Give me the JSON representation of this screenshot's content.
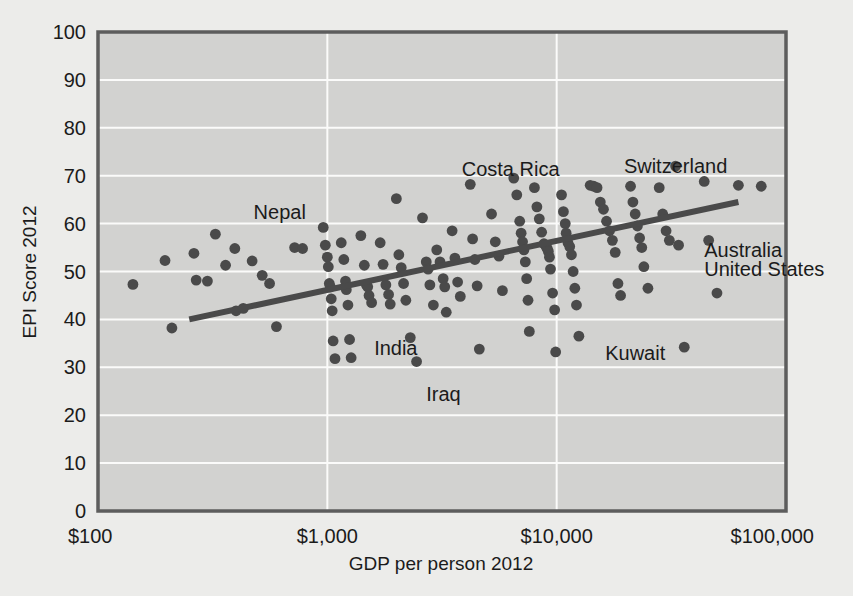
{
  "chart_data": {
    "type": "scatter",
    "title": "",
    "xlabel": "GDP per person 2012",
    "ylabel": "EPI Score 2012",
    "xscale": "log",
    "xlim": [
      100,
      100000
    ],
    "ylim": [
      0,
      100
    ],
    "grid": true,
    "legend": "none",
    "xticks": [
      "$100",
      "$1,000",
      "$10,000",
      "$100,000"
    ],
    "xtick_values": [
      100,
      1000,
      10000,
      100000
    ],
    "yticks": [
      "0",
      "10",
      "20",
      "30",
      "40",
      "50",
      "60",
      "70",
      "80",
      "90",
      "100"
    ],
    "ytick_values": [
      0,
      10,
      20,
      30,
      40,
      50,
      60,
      70,
      80,
      90,
      100
    ],
    "annotations": [
      {
        "text": "Nepal",
        "x": 620,
        "y": 62.5
      },
      {
        "text": "Costa Rica",
        "x": 6300,
        "y": 71.5
      },
      {
        "text": "Switzerland",
        "x": 33000,
        "y": 72.0
      },
      {
        "text": "Australia",
        "x": 44000,
        "y": 54.5
      },
      {
        "text": "United States",
        "x": 44000,
        "y": 50.5
      },
      {
        "text": "India",
        "x": 1600,
        "y": 34.0
      },
      {
        "text": "Iraq",
        "x": 2700,
        "y": 24.5
      },
      {
        "text": "Kuwait",
        "x": 22000,
        "y": 33.0
      }
    ],
    "trendline": {
      "x_start": 250,
      "y_start": 40.0,
      "x_end": 62000,
      "y_end": 64.5,
      "color": "#4a4a4a"
    },
    "series": [
      {
        "name": "Countries",
        "marker_color": "#4a4a4a",
        "points": [
          [
            142,
            47.3
          ],
          [
            196,
            52.3
          ],
          [
            210,
            38.2
          ],
          [
            262,
            53.8
          ],
          [
            268,
            48.2
          ],
          [
            300,
            48.0
          ],
          [
            325,
            57.8
          ],
          [
            360,
            51.3
          ],
          [
            395,
            54.8
          ],
          [
            400,
            41.8
          ],
          [
            430,
            42.3
          ],
          [
            470,
            52.2
          ],
          [
            520,
            49.2
          ],
          [
            560,
            47.5
          ],
          [
            600,
            38.5
          ],
          [
            720,
            55.0
          ],
          [
            780,
            54.8
          ],
          [
            960,
            59.2
          ],
          [
            980,
            55.5
          ],
          [
            1000,
            53.0
          ],
          [
            1010,
            51.0
          ],
          [
            1020,
            47.5
          ],
          [
            1030,
            46.8
          ],
          [
            1040,
            44.3
          ],
          [
            1050,
            41.8
          ],
          [
            1060,
            35.5
          ],
          [
            1080,
            31.8
          ],
          [
            1150,
            56.0
          ],
          [
            1180,
            52.5
          ],
          [
            1200,
            48.0
          ],
          [
            1210,
            46.2
          ],
          [
            1230,
            43.0
          ],
          [
            1250,
            35.8
          ],
          [
            1270,
            32.0
          ],
          [
            1400,
            57.5
          ],
          [
            1450,
            51.3
          ],
          [
            1480,
            47.2
          ],
          [
            1500,
            46.8
          ],
          [
            1520,
            45.0
          ],
          [
            1560,
            43.5
          ],
          [
            1700,
            56.0
          ],
          [
            1750,
            51.5
          ],
          [
            1800,
            47.2
          ],
          [
            1850,
            45.2
          ],
          [
            1880,
            43.2
          ],
          [
            2000,
            65.2
          ],
          [
            2050,
            53.5
          ],
          [
            2100,
            50.8
          ],
          [
            2150,
            47.5
          ],
          [
            2200,
            44.0
          ],
          [
            2300,
            36.2
          ],
          [
            2450,
            31.2
          ],
          [
            2600,
            61.2
          ],
          [
            2700,
            52.0
          ],
          [
            2750,
            50.5
          ],
          [
            2800,
            47.2
          ],
          [
            2900,
            43.0
          ],
          [
            3000,
            54.5
          ],
          [
            3100,
            52.0
          ],
          [
            3200,
            48.5
          ],
          [
            3250,
            46.8
          ],
          [
            3300,
            41.5
          ],
          [
            3500,
            58.5
          ],
          [
            3600,
            52.8
          ],
          [
            3700,
            47.8
          ],
          [
            3800,
            44.8
          ],
          [
            4200,
            68.2
          ],
          [
            4300,
            56.8
          ],
          [
            4400,
            52.5
          ],
          [
            4500,
            47.0
          ],
          [
            4600,
            33.8
          ],
          [
            5200,
            62.0
          ],
          [
            5400,
            56.2
          ],
          [
            5600,
            53.2
          ],
          [
            5800,
            46.0
          ],
          [
            6500,
            69.5
          ],
          [
            6700,
            66.0
          ],
          [
            6900,
            60.5
          ],
          [
            7000,
            58.0
          ],
          [
            7100,
            56.2
          ],
          [
            7200,
            54.5
          ],
          [
            7300,
            52.0
          ],
          [
            7400,
            48.5
          ],
          [
            7500,
            44.0
          ],
          [
            7600,
            37.5
          ],
          [
            8000,
            67.5
          ],
          [
            8200,
            63.5
          ],
          [
            8400,
            61.0
          ],
          [
            8600,
            58.2
          ],
          [
            8800,
            55.8
          ],
          [
            9000,
            55.2
          ],
          [
            9100,
            54.8
          ],
          [
            9200,
            54.2
          ],
          [
            9300,
            53.0
          ],
          [
            9400,
            50.5
          ],
          [
            9600,
            45.5
          ],
          [
            9800,
            42.0
          ],
          [
            9900,
            33.2
          ],
          [
            10500,
            66.0
          ],
          [
            10700,
            62.5
          ],
          [
            10900,
            60.0
          ],
          [
            11000,
            58.0
          ],
          [
            11200,
            56.0
          ],
          [
            11400,
            55.2
          ],
          [
            11600,
            53.5
          ],
          [
            11800,
            50.0
          ],
          [
            12000,
            46.5
          ],
          [
            12200,
            43.0
          ],
          [
            12500,
            36.5
          ],
          [
            14000,
            68.0
          ],
          [
            14500,
            67.8
          ],
          [
            15000,
            67.5
          ],
          [
            15500,
            64.5
          ],
          [
            16000,
            63.0
          ],
          [
            16500,
            60.5
          ],
          [
            17000,
            58.5
          ],
          [
            17500,
            56.5
          ],
          [
            18000,
            54.0
          ],
          [
            18500,
            47.5
          ],
          [
            19000,
            45.0
          ],
          [
            21000,
            67.8
          ],
          [
            21500,
            64.5
          ],
          [
            22000,
            62.0
          ],
          [
            22500,
            59.5
          ],
          [
            23000,
            57.0
          ],
          [
            23500,
            55.0
          ],
          [
            24000,
            51.0
          ],
          [
            25000,
            46.5
          ],
          [
            28000,
            67.5
          ],
          [
            29000,
            62.0
          ],
          [
            30000,
            58.5
          ],
          [
            31000,
            56.5
          ],
          [
            33000,
            72.0
          ],
          [
            34000,
            55.5
          ],
          [
            36000,
            34.2
          ],
          [
            44000,
            68.8
          ],
          [
            46000,
            56.5
          ],
          [
            50000,
            45.5
          ],
          [
            62000,
            68.0
          ],
          [
            78000,
            67.8
          ]
        ]
      }
    ]
  },
  "axis": {
    "y_title": "EPI Score 2012",
    "x_title": "GDP per person 2012"
  }
}
